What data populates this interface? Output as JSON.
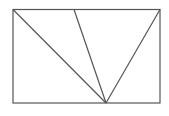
{
  "diagram": {
    "stroke_color": "#555555",
    "background": "#ffffff",
    "rectangle": {
      "x1": 13,
      "y1": 9.5,
      "x2": 160,
      "y2": 103
    },
    "apex": {
      "x": 106,
      "y": 103
    },
    "lines": [
      {
        "name": "left-diagonal",
        "from": [
          13,
          9.5
        ],
        "to": [
          106,
          103
        ]
      },
      {
        "name": "middle-diagonal",
        "from": [
          74,
          9.5
        ],
        "to": [
          106,
          103
        ]
      },
      {
        "name": "right-diagonal",
        "from": [
          160,
          9.5
        ],
        "to": [
          106,
          103
        ]
      }
    ]
  }
}
